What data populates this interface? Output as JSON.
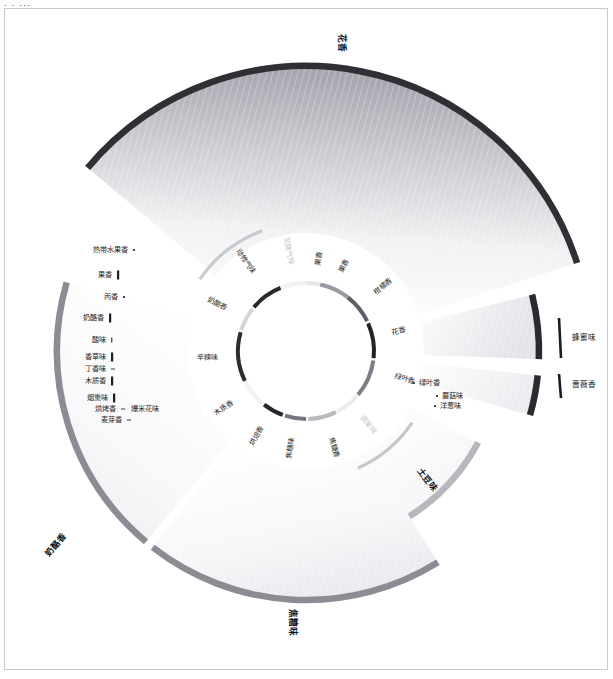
{
  "page": {
    "corner_marks": "· · ···",
    "background": "#ffffff",
    "frame_color": "#c9c9cf"
  },
  "chart_data": {
    "type": "pie",
    "subtitle": "",
    "xlabel": "",
    "ylabel": "",
    "legend_position": "none",
    "grid": false,
    "center": [
      306,
      351
    ],
    "inner_ring": {
      "radius": 68,
      "thickness": 4,
      "note": "中心环 — 一级风味类别弧段",
      "segments": [
        {
          "label": "果香",
          "start_deg": -78,
          "end_deg": -52,
          "color": "#9a9aa2",
          "value": 26
        },
        {
          "label": "柑橘香",
          "start_deg": -52,
          "end_deg": -26,
          "color": "#5e5e68",
          "value": 26
        },
        {
          "label": "花香",
          "start_deg": -24,
          "end_deg": 6,
          "color": "#232329",
          "value": 30
        },
        {
          "label": "绿叶香",
          "start_deg": 8,
          "end_deg": 40,
          "color": "#7d7d87",
          "value": 32
        },
        {
          "label": "蔬果味",
          "start_deg": 42,
          "end_deg": 62,
          "color": "#ececef",
          "value": 20
        },
        {
          "label": "焦糖香",
          "start_deg": 64,
          "end_deg": 88,
          "color": "#b9b9c0",
          "value": 24
        },
        {
          "label": "焦糖味",
          "start_deg": 90,
          "end_deg": 108,
          "color": "#76767f",
          "value": 18
        },
        {
          "label": "烘焙香",
          "start_deg": 110,
          "end_deg": 128,
          "color": "#26262c",
          "value": 18
        },
        {
          "label": "木质香",
          "start_deg": 130,
          "end_deg": 152,
          "color": "#f0f0f2",
          "value": 22
        },
        {
          "label": "辛辣味",
          "start_deg": 154,
          "end_deg": 196,
          "color": "#2c2c33",
          "value": 42
        },
        {
          "label": "奶酪香",
          "start_deg": 198,
          "end_deg": 218,
          "color": "#d4d4d9",
          "value": 20
        },
        {
          "label": "动物气味",
          "start_deg": 220,
          "end_deg": 248,
          "color": "#28282f",
          "value": 28
        },
        {
          "label": "发酵气味",
          "start_deg": 250,
          "end_deg": 268,
          "color": "#f2f2f4",
          "value": 18
        },
        {
          "label": "果香2",
          "start_deg": 270,
          "end_deg": 282,
          "color": "#e6e6ea",
          "value": 12
        }
      ]
    },
    "outer_wedges": [
      {
        "label": "花香",
        "name": "floral-wedge",
        "start_deg": -140,
        "end_deg": -18,
        "inner_r": 118,
        "outer_r": 288,
        "rim_color": "#2f2f35",
        "fill_from": "#9d9da6",
        "fill_to": "#fbfbfc",
        "value": 122
      },
      {
        "label": "蜂蜜味",
        "name": "honey-wedge",
        "start_deg": -14,
        "end_deg": 2,
        "inner_r": 118,
        "outer_r": 236,
        "rim_color": "#2a2a30",
        "fill_from": "#dcdce1",
        "fill_to": "#fcfcfd",
        "value": 16
      },
      {
        "label": "蔷薇香",
        "name": "rose-wedge",
        "start_deg": 6,
        "end_deg": 16,
        "inner_r": 118,
        "outer_r": 236,
        "rim_color": "#2a2a30",
        "fill_from": "#e6e6ea",
        "fill_to": "#fdfdfd",
        "value": 10
      },
      {
        "label": "土豆味",
        "name": "potato-wedge",
        "start_deg": 28,
        "end_deg": 66,
        "inner_r": 118,
        "outer_r": 198,
        "rim_color": "#b7b7bd",
        "fill_from": "#f2f2f4",
        "fill_to": "#ffffff",
        "value": 38
      },
      {
        "label": "焦糖味",
        "name": "caramel-wedge",
        "start_deg": 58,
        "end_deg": 128,
        "inner_r": 118,
        "outer_r": 252,
        "rim_color": "#8c8c95",
        "fill_from": "#fafafb",
        "fill_to": "#ededf0",
        "value": 70
      },
      {
        "label": "奶酪香",
        "name": "cheese-wedge",
        "start_deg": 130,
        "end_deg": 196,
        "inner_r": 118,
        "outer_r": 252,
        "rim_color": "#8c8c95",
        "fill_from": "#fbfbfc",
        "fill_to": "#efeff2",
        "value": 66
      }
    ],
    "spoke_arcs": [
      {
        "label": "果香弧",
        "name": "fruit-spoke-arc",
        "color": "#c9c9cf",
        "start_deg": 214,
        "end_deg": 250,
        "radius": 128
      },
      {
        "label": "土豆弧",
        "name": "potato-spoke-arc",
        "color": "#c6c6cc",
        "start_deg": 34,
        "end_deg": 66,
        "radius": 128
      }
    ],
    "leaf_labels": [
      {
        "label": "热带水果香",
        "group": "果香",
        "marker": "dot",
        "x": 128,
        "y": 250,
        "anchor": "end"
      },
      {
        "label": "果香",
        "group": "果香",
        "marker": "bar",
        "x": 112,
        "y": 275,
        "anchor": "end"
      },
      {
        "label": "丙香",
        "group": "果香",
        "marker": "dot",
        "x": 118,
        "y": 297,
        "anchor": "end"
      },
      {
        "label": "奶酪香",
        "group": "奶酪",
        "marker": "bar",
        "x": 104,
        "y": 318,
        "anchor": "end"
      },
      {
        "label": "酸味",
        "group": "奶酪",
        "marker": "tiny",
        "x": 106,
        "y": 340,
        "anchor": "end"
      },
      {
        "label": "香草味",
        "group": "辛辣",
        "marker": "bar",
        "x": 106,
        "y": 357,
        "anchor": "end"
      },
      {
        "label": "丁香味",
        "group": "辛辣",
        "marker": "dash",
        "x": 106,
        "y": 369,
        "anchor": "end"
      },
      {
        "label": "木质香",
        "group": "木质",
        "marker": "bar",
        "x": 106,
        "y": 381,
        "anchor": "end"
      },
      {
        "label": "烟熏味",
        "group": "烘焙",
        "marker": "bar",
        "x": 108,
        "y": 398,
        "anchor": "end"
      },
      {
        "label": "烘烤香",
        "group": "烘焙",
        "marker": "dash",
        "x": 116,
        "y": 409,
        "anchor": "end"
      },
      {
        "label": "爆米花味",
        "group": "烘焙",
        "marker": "none",
        "x": 131,
        "y": 409,
        "anchor": "start"
      },
      {
        "label": "麦芽香",
        "group": "烘焙",
        "marker": "dash",
        "x": 122,
        "y": 420,
        "anchor": "end"
      },
      {
        "label": "绿叶香",
        "group": "绿叶",
        "marker": "dot",
        "x": 419,
        "y": 383,
        "anchor": "start"
      },
      {
        "label": "蘑菇味",
        "group": "蔬果",
        "marker": "dot",
        "x": 442,
        "y": 396,
        "anchor": "start"
      },
      {
        "label": "洋葱味",
        "group": "蔬果",
        "marker": "dot",
        "x": 440,
        "y": 406,
        "anchor": "start"
      }
    ],
    "outer_tick_labels": [
      {
        "label": "蜂蜜味",
        "x": 572,
        "y": 338,
        "tick_x": 559,
        "tick_y1": 318,
        "tick_y2": 358,
        "color": "#1b1b21"
      },
      {
        "label": "蔷薇香",
        "x": 572,
        "y": 385,
        "tick_x": 559,
        "tick_y1": 374,
        "tick_y2": 398,
        "color": "#1b1b21"
      }
    ],
    "radial_titles": [
      {
        "label": "花香",
        "name": "floral-title",
        "x": 341,
        "y": 43,
        "rotate": 90,
        "size": 9
      },
      {
        "label": "奶酪香",
        "name": "cheese-title",
        "x": 56,
        "y": 545,
        "rotate": -50,
        "size": 9
      },
      {
        "label": "焦糖味",
        "name": "caramel-title",
        "x": 292,
        "y": 622,
        "rotate": 90,
        "size": 9
      },
      {
        "label": "土豆味",
        "name": "potato-title",
        "x": 427,
        "y": 480,
        "rotate": 52,
        "size": 7.6
      }
    ],
    "ring_labels": [
      {
        "label": "果香",
        "angle_deg": -66,
        "radius": 86,
        "faint": false
      },
      {
        "label": "柑橘香",
        "angle_deg": -40,
        "radius": 90,
        "faint": false
      },
      {
        "label": "花香",
        "angle_deg": -12,
        "radius": 88,
        "faint": false
      },
      {
        "label": "绿叶香",
        "angle_deg": 16,
        "radius": 92,
        "faint": false
      },
      {
        "label": "蔬果味",
        "angle_deg": 50,
        "radius": 86,
        "faint": true
      },
      {
        "label": "焦糖香",
        "angle_deg": 74,
        "radius": 90,
        "faint": false
      },
      {
        "label": "焦糖味",
        "angle_deg": 99,
        "radius": 88,
        "faint": false
      },
      {
        "label": "烘焙香",
        "angle_deg": 120,
        "radius": 88,
        "faint": false
      },
      {
        "label": "木质香",
        "angle_deg": 145,
        "radius": 90,
        "faint": false
      },
      {
        "label": "辛辣味",
        "angle_deg": 176,
        "radius": 88,
        "faint": false
      },
      {
        "label": "奶酪香",
        "angle_deg": 208,
        "radius": 90,
        "faint": false
      },
      {
        "label": "动物气味",
        "angle_deg": 236,
        "radius": 94,
        "faint": false
      },
      {
        "label": "发酵气味",
        "angle_deg": 260,
        "radius": 88,
        "faint": true
      },
      {
        "label": "果香",
        "angle_deg": 278,
        "radius": 86,
        "faint": false
      }
    ]
  }
}
